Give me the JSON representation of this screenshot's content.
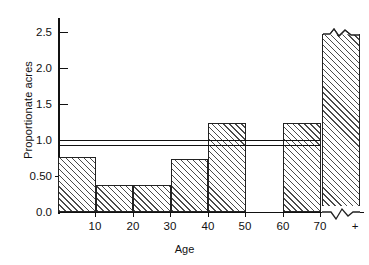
{
  "chart_data": {
    "type": "bar",
    "title": "",
    "subtitle": "",
    "xlabel": "Age",
    "ylabel": "Proportionate acres",
    "grid": false,
    "legend": null,
    "ylim": [
      0.0,
      2.7
    ],
    "xlim": [
      0,
      80
    ],
    "ytick_labels": [
      "2.5",
      "2.0",
      "1.5",
      "1.0",
      "0.50",
      "0.0"
    ],
    "ytick_values": [
      2.5,
      2.0,
      1.5,
      1.0,
      0.5,
      0.0
    ],
    "xtick_labels": [
      "10",
      "20",
      "30",
      "40",
      "50",
      "60",
      "70",
      "+"
    ],
    "xtick_values": [
      10,
      20,
      30,
      40,
      50,
      60,
      70,
      80
    ],
    "categories": [
      "0-10",
      "10-20",
      "20-30",
      "30-40",
      "40-50",
      "50-60",
      "60-70",
      "70+"
    ],
    "values": [
      0.76,
      0.37,
      0.37,
      0.74,
      1.23,
      0.0,
      1.23,
      2.47
    ],
    "bar_notes": [
      "hatched",
      "hatched",
      "hatched",
      "hatched",
      "hatched",
      "empty / zero",
      "hatched",
      "hatched, axis break (zigzag) at top and bottom"
    ],
    "reference_lines": [
      {
        "name": "unity-line",
        "value": 1.0,
        "extent": "0 to 70"
      },
      {
        "name": "secondary-line",
        "value": 0.93,
        "extent": "0 to 70"
      }
    ],
    "annotations": [
      {
        "name": "axis-break-top",
        "note": "zigzag break on top edge of 70+ bar"
      },
      {
        "name": "axis-break-bottom",
        "note": "zigzag break on baseline under 70+ bar"
      }
    ]
  },
  "axis": {
    "y_title": "Proportionate acres",
    "x_title": "Age",
    "ticks_y": [
      {
        "label": "2.5",
        "value": 2.5
      },
      {
        "label": "2.0",
        "value": 2.0
      },
      {
        "label": "1.5",
        "value": 1.5
      },
      {
        "label": "1.0",
        "value": 1.0
      },
      {
        "label": "0.50",
        "value": 0.5
      },
      {
        "label": "0.0",
        "value": 0.0
      }
    ],
    "ticks_x": [
      {
        "label": "10",
        "value": 10
      },
      {
        "label": "20",
        "value": 20
      },
      {
        "label": "30",
        "value": 30
      },
      {
        "label": "40",
        "value": 40
      },
      {
        "label": "50",
        "value": 50
      },
      {
        "label": "60",
        "value": 60
      },
      {
        "label": "70",
        "value": 70
      },
      {
        "label": "+",
        "value": 80
      }
    ]
  },
  "colors": {
    "ink": "#111111",
    "hatch": "#4b4b4b",
    "background": "#ffffff"
  }
}
